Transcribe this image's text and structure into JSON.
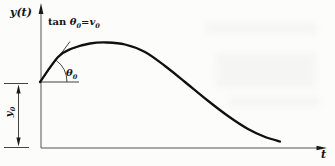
{
  "figure": {
    "y_axis_label": "y(t)",
    "t_axis_label": "t",
    "tangent_annotation": {
      "fn": "tan ",
      "theta": "θ",
      "theta_sub": "0",
      "eq": "=",
      "v": "v",
      "v_sub": "0"
    },
    "angle_label": {
      "symbol": "θ",
      "sub": "0"
    },
    "initial_value_label": {
      "symbol": "y",
      "sub": "0"
    }
  },
  "chart_data": {
    "type": "line",
    "title": "",
    "xlabel": "t",
    "ylabel": "y(t)",
    "x_ticks": [],
    "y_ticks": [],
    "grid": false,
    "legend": false,
    "annotations": [
      "tan θ₀=v₀",
      "θ₀",
      "y₀"
    ],
    "series": [
      {
        "name": "y(t)",
        "shape": "starts at y₀ on the y-axis with slope tan θ₀ = v₀, rises to a broad maximum, then decays monotonically toward the t-axis",
        "points_px": [
          [
            40,
            82
          ],
          [
            58,
            57
          ],
          [
            72,
            48.5
          ],
          [
            90,
            43.5
          ],
          [
            107,
            42.5
          ],
          [
            125,
            44.5
          ],
          [
            145,
            52
          ],
          [
            165,
            66
          ],
          [
            185,
            82
          ],
          [
            207,
            100
          ],
          [
            228,
            116
          ],
          [
            248,
            129
          ],
          [
            264,
            136.5
          ],
          [
            280,
            141.5
          ]
        ]
      }
    ],
    "axes_origin_px": [
      41,
      148
    ]
  },
  "geometry": {
    "tangent_line_px": {
      "x1": 40,
      "y1": 82,
      "x2": 70,
      "y2": 41.5
    },
    "horizontal_ref_px": {
      "x1": 40,
      "y1": 82,
      "x2": 79,
      "y2": 82
    },
    "angle_arc_px": {
      "cx": 40,
      "cy": 82,
      "r": 27,
      "start_deg": 0,
      "end_deg": 53
    }
  }
}
